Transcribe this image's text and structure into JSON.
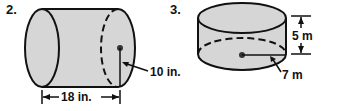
{
  "figures": [
    {
      "number": "2.",
      "shape": "cylinder-horizontal",
      "labels": {
        "radius": "10 in.",
        "length": "18 in."
      }
    },
    {
      "number": "3.",
      "shape": "cylinder-vertical",
      "labels": {
        "height": "5 m",
        "radius": "7 m"
      }
    }
  ],
  "colors": {
    "fill": "#d6d6d6",
    "stroke": "#111111"
  }
}
